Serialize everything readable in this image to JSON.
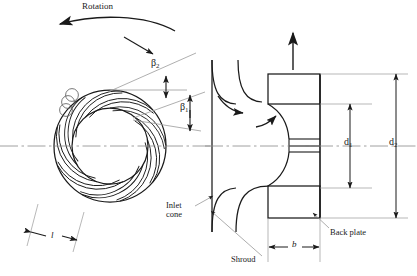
{
  "figure": {
    "type": "engineering-diagram",
    "labels": {
      "rotation": "Rotation",
      "beta2": "β",
      "beta2_sub": "2",
      "beta1": "β",
      "beta1_sub": "1",
      "blade_length": "l",
      "inlet_cone_line1": "Inlet",
      "inlet_cone_line2": "cone",
      "shroud": "Shroud",
      "back_plate": "Back plate",
      "d1": "d",
      "d1_sub": "1",
      "d2": "d",
      "d2_sub": "2",
      "width_b": "b"
    },
    "colors": {
      "line": "#1a1a1a",
      "thin_line": "#555555",
      "centerline": "#888888",
      "leader": "#777777",
      "background": "#ffffff"
    },
    "plan_view": {
      "center_x": 110,
      "center_y": 146,
      "outer_radius": 56,
      "inner_radius": 38,
      "blade_count": 9,
      "blade_curvature": "backward-curved"
    },
    "section_view": {
      "centerline_y": 146,
      "back_plate_x": 320,
      "blade_outer_x": 268,
      "shroud_left_x": 212
    }
  }
}
